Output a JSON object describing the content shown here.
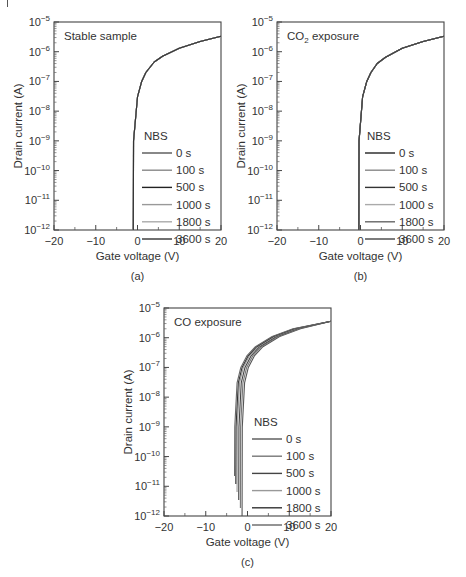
{
  "figure": {
    "panels": [
      {
        "id": "a",
        "caption": "(a)",
        "title": "Stable sample",
        "title_sub": "",
        "title_rest": ""
      },
      {
        "id": "b",
        "caption": "(b)",
        "title": "CO",
        "title_sub": "2",
        "title_rest": " exposure"
      },
      {
        "id": "c",
        "caption": "(c)",
        "title": "CO exposure",
        "title_sub": "",
        "title_rest": ""
      }
    ]
  },
  "chart_data": [
    {
      "type": "line",
      "title": "Stable sample",
      "caption": "(a)",
      "xlabel": "Gate voltage (V)",
      "ylabel": "Drain current (A)",
      "xlim": [
        -20,
        20
      ],
      "ylim": [
        1e-12,
        1e-05
      ],
      "yscale": "log",
      "xticks": [
        "−20",
        "−10",
        "0",
        "10",
        "20"
      ],
      "yticks": [
        "10^-12",
        "10^-11",
        "10^-10",
        "10^-9",
        "10^-8",
        "10^-7",
        "10^-6",
        "10^-5"
      ],
      "legend_title": "NBS",
      "legend_position": "lower right",
      "grid": false,
      "series": [
        {
          "name": "0 s",
          "color": "#555555",
          "turn_on_V": -1.0
        },
        {
          "name": "100 s",
          "color": "#888888",
          "turn_on_V": -1.0
        },
        {
          "name": "500 s",
          "color": "#222222",
          "turn_on_V": -1.0
        },
        {
          "name": "1000 s",
          "color": "#999999",
          "turn_on_V": -1.0
        },
        {
          "name": "1800 s",
          "color": "#aaaaaa",
          "turn_on_V": -1.0
        },
        {
          "name": "3600 s",
          "color": "#333333",
          "turn_on_V": -1.0
        }
      ],
      "x": [
        -1,
        0,
        1,
        2,
        4,
        6,
        10,
        15,
        20
      ],
      "y_common": [
        1e-12,
        3e-08,
        1e-07,
        2e-07,
        4.5e-07,
        7e-07,
        1.3e-06,
        2.2e-06,
        3.3e-06
      ]
    },
    {
      "type": "line",
      "title": "CO2 exposure",
      "caption": "(b)",
      "xlabel": "Gate voltage (V)",
      "ylabel": "Drain current (A)",
      "xlim": [
        -20,
        20
      ],
      "ylim": [
        1e-12,
        1e-05
      ],
      "yscale": "log",
      "xticks": [
        "−20",
        "−10",
        "0",
        "10",
        "20"
      ],
      "yticks": [
        "10^-12",
        "10^-11",
        "10^-10",
        "10^-9",
        "10^-8",
        "10^-7",
        "10^-6",
        "10^-5"
      ],
      "legend_title": "NBS",
      "legend_position": "lower right",
      "grid": false,
      "series": [
        {
          "name": "0 s",
          "color": "#222222",
          "turn_on_V": -0.4
        },
        {
          "name": "100 s",
          "color": "#888888",
          "turn_on_V": -0.4
        },
        {
          "name": "500 s",
          "color": "#333333",
          "turn_on_V": -0.4
        },
        {
          "name": "1000 s",
          "color": "#aaaaaa",
          "turn_on_V": -0.4
        },
        {
          "name": "1800 s",
          "color": "#666666",
          "turn_on_V": -0.4
        },
        {
          "name": "3600 s",
          "color": "#444444",
          "turn_on_V": -0.4
        }
      ],
      "x": [
        -0.4,
        0.5,
        1.5,
        2.5,
        4,
        6,
        10,
        15,
        20
      ],
      "y_common": [
        2e-12,
        3e-08,
        1e-07,
        2e-07,
        4e-07,
        6.5e-07,
        1.3e-06,
        2.2e-06,
        3.3e-06
      ]
    },
    {
      "type": "line",
      "title": "CO exposure",
      "caption": "(c)",
      "xlabel": "Gate voltage (V)",
      "ylabel": "Drain current (A)",
      "xlim": [
        -20,
        20
      ],
      "ylim": [
        1e-12,
        1e-05
      ],
      "yscale": "log",
      "xticks": [
        "−20",
        "−10",
        "0",
        "10",
        "20"
      ],
      "yticks": [
        "10^-12",
        "10^-11",
        "10^-10",
        "10^-9",
        "10^-8",
        "10^-7",
        "10^-6",
        "10^-5"
      ],
      "legend_title": "NBS",
      "legend_position": "lower right",
      "grid": false,
      "series": [
        {
          "name": "0 s",
          "color": "#555555",
          "turn_on_V": -1.3
        },
        {
          "name": "100 s",
          "color": "#777777",
          "turn_on_V": -1.7
        },
        {
          "name": "500 s",
          "color": "#444444",
          "turn_on_V": -2.1
        },
        {
          "name": "1000 s",
          "color": "#999999",
          "turn_on_V": -2.5
        },
        {
          "name": "1800 s",
          "color": "#333333",
          "turn_on_V": -2.8
        },
        {
          "name": "3600 s",
          "color": "#666666",
          "turn_on_V": -3.1
        }
      ],
      "x_relative_to_turn_on": [
        0,
        0.6,
        1.5,
        3,
        5,
        9,
        14,
        21.3
      ],
      "y_common": [
        1e-11,
        3e-08,
        1e-07,
        2.5e-07,
        5e-07,
        1.1e-06,
        2e-06,
        3.6e-06
      ]
    }
  ]
}
